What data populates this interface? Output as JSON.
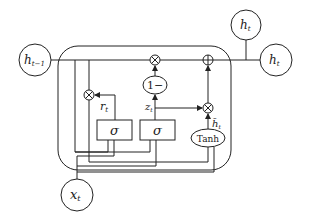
{
  "diagram": {
    "nodes": {
      "h_prev": {
        "label": "h",
        "sub": "t−1"
      },
      "h_out_top": {
        "label": "h",
        "sub": "t"
      },
      "h_out_right": {
        "label": "h",
        "sub": "t"
      },
      "x_in": {
        "label": "x",
        "sub": "t"
      }
    },
    "gates": {
      "sigma_reset": "σ",
      "sigma_update": "σ",
      "one_minus": "1−",
      "tanh": "Tanh"
    },
    "signals": {
      "r": {
        "label": "r",
        "sub": "t"
      },
      "z": {
        "label": "z",
        "sub": "t"
      },
      "h_tilde": {
        "label": "h̃",
        "sub": "t"
      }
    },
    "operators": {
      "multiply": "⊗",
      "add": "⊕"
    }
  }
}
